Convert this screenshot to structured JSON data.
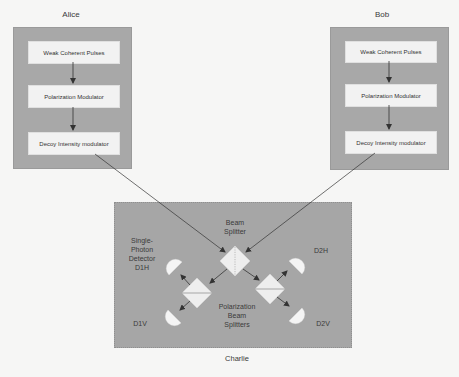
{
  "alice": {
    "label": "Alice",
    "components": [
      "Weak Coherent Pulses",
      "Polarization Modulator",
      "Decoy Intensity modulator"
    ]
  },
  "bob": {
    "label": "Bob",
    "components": [
      "Weak Coherent Pulses",
      "Polarization Modulator",
      "Decoy Intensity modulator"
    ]
  },
  "charlie": {
    "label": "Charlie",
    "beam_splitter": "Beam\nSplitter",
    "beam_splitter_line1": "Beam",
    "beam_splitter_line2": "Splitter",
    "detector_caption_line1": "Single-",
    "detector_caption_line2": "Photon",
    "detector_caption_line3": "Detector",
    "detectors": {
      "d1h": "D1H",
      "d1v": "D1V",
      "d2h": "D2H",
      "d2v": "D2V"
    },
    "pbs_line1": "Polarization",
    "pbs_line2": "Beam",
    "pbs_line3": "Splitters"
  },
  "colors": {
    "party_box": "#a8a8a8",
    "component_box": "#f2f2f2",
    "element_fill": "#eeeeee",
    "arrow": "#333333"
  }
}
